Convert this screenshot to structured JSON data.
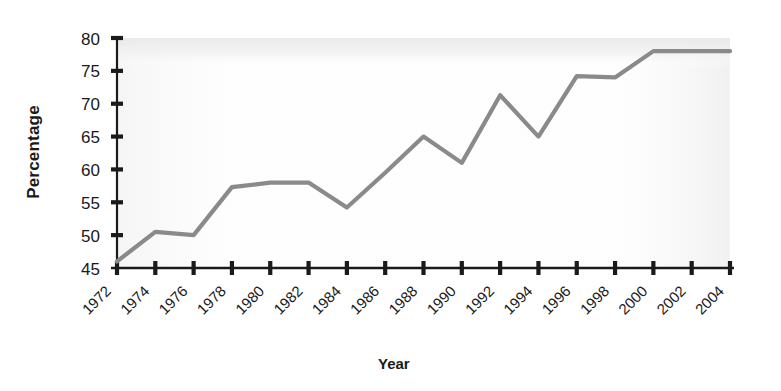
{
  "chart_data": {
    "type": "line",
    "title": "",
    "xlabel": "Year",
    "ylabel": "Percentage",
    "x": [
      1972,
      1974,
      1976,
      1978,
      1980,
      1982,
      1984,
      1986,
      1988,
      1990,
      1992,
      1994,
      1996,
      1998,
      2000,
      2002,
      2004
    ],
    "values": [
      46,
      50.5,
      50,
      57.3,
      58,
      58,
      54.2,
      59.5,
      65,
      61,
      71.3,
      65,
      74.2,
      74,
      78,
      78,
      78
    ],
    "series": [
      {
        "name": "Percentage",
        "values": [
          46,
          50.5,
          50,
          57.3,
          58,
          58,
          54.2,
          59.5,
          65,
          61,
          71.3,
          65,
          74.2,
          74,
          78,
          78,
          78
        ],
        "color": "#8a8a8a"
      }
    ],
    "xticklabels": [
      "1972",
      "1974",
      "1976",
      "1978",
      "1980",
      "1982",
      "1984",
      "1986",
      "1988",
      "1990",
      "1992",
      "1994",
      "1996",
      "1998",
      "2000",
      "2002",
      "2004"
    ],
    "yticklabels": [
      "45",
      "50",
      "55",
      "60",
      "65",
      "70",
      "75",
      "80"
    ],
    "yticks": [
      45,
      50,
      55,
      60,
      65,
      70,
      75,
      80
    ],
    "ylim": [
      45,
      80
    ],
    "xlim": [
      1972,
      2004
    ],
    "grid": false,
    "legend": false,
    "legend_position": "none",
    "xtick_label_rotation": -45,
    "line_color": "#8a8a8a",
    "axis_color": "#1a1a1a",
    "text_color": "#1a1a1a",
    "background_color": "#ffffff"
  },
  "axes": {
    "y_title": "Percentage",
    "x_title": "Year"
  }
}
